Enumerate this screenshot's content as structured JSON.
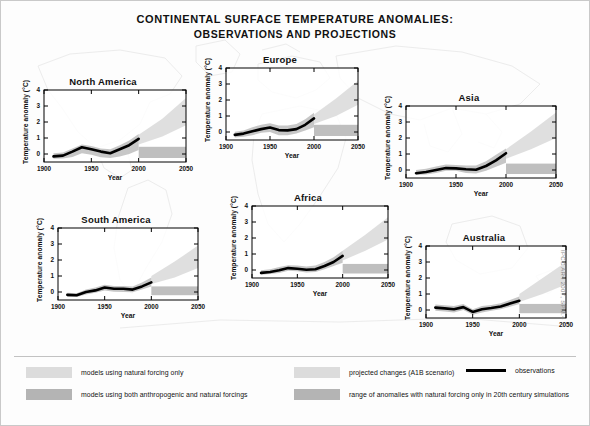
{
  "title": {
    "line1": "Continental Surface Temperature Anomalies:",
    "line2": "Observations and Projections"
  },
  "axis_labels": {
    "x": "Year",
    "y": "Temperature anomaly (°C)"
  },
  "source_credit": "IPCC AR4 2007, SPM.4",
  "legend": {
    "natural_only": "models using natural forcing only",
    "anthro_and_natural": "models using both anthropogenic and natural forcings",
    "projected": "projected changes (A1B scenario)",
    "range_20c": "range of anomalies with natural forcing only in 20th century simulations",
    "observations": "observations"
  },
  "colors": {
    "observation_line": "#000000",
    "natural_band": "#dcdcdc",
    "anthro_band": "#b4b4b4",
    "projection_wedge": "#dcdcdc",
    "range_band": "#b4b4b4",
    "map_outline": "#b9b9b9",
    "axis": "#000000",
    "divider": "#c2c2c2"
  },
  "chart_data": {
    "type": "line",
    "title": "Continental Surface Temperature Anomalies: Observations and Projections",
    "xlabel": "Year",
    "ylabel": "Temperature anomaly (°C)",
    "xlim": [
      1900,
      2050
    ],
    "ylim": [
      -0.5,
      4
    ],
    "xticks": [
      1900,
      1950,
      2000,
      2050
    ],
    "yticks": [
      0,
      1,
      2,
      3,
      4
    ],
    "grid": false,
    "legend_position": "bottom",
    "panels": [
      {
        "name": "North America",
        "x": [
          1910,
          1920,
          1930,
          1940,
          1950,
          1960,
          1970,
          1980,
          1990,
          2000
        ],
        "observations": [
          -0.15,
          -0.1,
          0.15,
          0.42,
          0.3,
          0.15,
          0.05,
          0.3,
          0.55,
          0.95
        ],
        "natural_band_low": [
          -0.3,
          -0.28,
          -0.18,
          0.05,
          -0.05,
          -0.2,
          -0.25,
          -0.15,
          0.0,
          0.25
        ],
        "natural_band_high": [
          0.05,
          0.1,
          0.35,
          0.6,
          0.5,
          0.35,
          0.3,
          0.55,
          0.85,
          1.25
        ],
        "projection": {
          "x": [
            2000,
            2025,
            2050
          ],
          "low": [
            0.6,
            1.1,
            1.8
          ],
          "high": [
            1.2,
            2.2,
            3.5
          ]
        },
        "range_band": {
          "x": [
            2000,
            2050
          ],
          "low": -0.25,
          "high": 0.45
        }
      },
      {
        "name": "Europe",
        "x": [
          1910,
          1920,
          1930,
          1940,
          1950,
          1960,
          1970,
          1980,
          1990,
          2000
        ],
        "observations": [
          -0.18,
          -0.1,
          0.05,
          0.18,
          0.28,
          0.12,
          0.1,
          0.18,
          0.45,
          0.85
        ],
        "natural_band_low": [
          -0.35,
          -0.3,
          -0.2,
          -0.05,
          0.0,
          -0.2,
          -0.2,
          -0.1,
          0.1,
          0.3
        ],
        "natural_band_high": [
          0.02,
          0.1,
          0.3,
          0.45,
          0.55,
          0.4,
          0.4,
          0.5,
          0.8,
          1.2
        ],
        "projection": {
          "x": [
            2000,
            2025,
            2050
          ],
          "low": [
            0.5,
            1.0,
            1.7
          ],
          "high": [
            1.1,
            2.1,
            3.2
          ]
        },
        "range_band": {
          "x": [
            2000,
            2050
          ],
          "low": -0.25,
          "high": 0.45
        }
      },
      {
        "name": "Asia",
        "x": [
          1910,
          1920,
          1930,
          1940,
          1950,
          1960,
          1970,
          1980,
          1990,
          2000
        ],
        "observations": [
          -0.2,
          -0.12,
          0.0,
          0.12,
          0.1,
          0.05,
          0.02,
          0.25,
          0.6,
          1.05
        ],
        "natural_band_low": [
          -0.32,
          -0.28,
          -0.18,
          -0.05,
          -0.05,
          -0.18,
          -0.22,
          -0.05,
          0.2,
          0.45
        ],
        "natural_band_high": [
          0.0,
          0.08,
          0.22,
          0.35,
          0.32,
          0.28,
          0.28,
          0.55,
          0.95,
          1.35
        ],
        "projection": {
          "x": [
            2000,
            2025,
            2050
          ],
          "low": [
            0.7,
            1.3,
            2.0
          ],
          "high": [
            1.3,
            2.4,
            3.6
          ]
        },
        "range_band": {
          "x": [
            2000,
            2050
          ],
          "low": -0.25,
          "high": 0.4
        }
      },
      {
        "name": "Africa",
        "x": [
          1910,
          1920,
          1930,
          1940,
          1950,
          1960,
          1970,
          1980,
          1990,
          2000
        ],
        "observations": [
          -0.18,
          -0.12,
          -0.02,
          0.12,
          0.08,
          0.02,
          0.05,
          0.25,
          0.5,
          0.88
        ],
        "natural_band_low": [
          -0.3,
          -0.25,
          -0.18,
          -0.05,
          -0.08,
          -0.15,
          -0.12,
          0.05,
          0.25,
          0.45
        ],
        "natural_band_high": [
          -0.02,
          0.05,
          0.18,
          0.3,
          0.28,
          0.22,
          0.28,
          0.5,
          0.8,
          1.2
        ],
        "projection": {
          "x": [
            2000,
            2025,
            2050
          ],
          "low": [
            0.6,
            1.2,
            1.9
          ],
          "high": [
            1.2,
            2.2,
            3.3
          ]
        },
        "range_band": {
          "x": [
            2000,
            2050
          ],
          "low": -0.22,
          "high": 0.38
        }
      },
      {
        "name": "South America",
        "x": [
          1910,
          1920,
          1930,
          1940,
          1950,
          1960,
          1970,
          1980,
          1990,
          2000
        ],
        "observations": [
          -0.18,
          -0.2,
          0.0,
          0.1,
          0.28,
          0.2,
          0.2,
          0.15,
          0.35,
          0.6
        ],
        "natural_band_low": [
          -0.3,
          -0.32,
          -0.15,
          -0.05,
          0.1,
          0.02,
          0.0,
          -0.02,
          0.15,
          0.35
        ],
        "natural_band_high": [
          -0.05,
          -0.08,
          0.15,
          0.28,
          0.45,
          0.38,
          0.38,
          0.35,
          0.6,
          0.9
        ],
        "projection": {
          "x": [
            2000,
            2025,
            2050
          ],
          "low": [
            0.5,
            0.9,
            1.5
          ],
          "high": [
            1.0,
            1.9,
            2.9
          ]
        },
        "range_band": {
          "x": [
            2000,
            2050
          ],
          "low": -0.2,
          "high": 0.35
        }
      },
      {
        "name": "Australia",
        "x": [
          1910,
          1920,
          1930,
          1940,
          1950,
          1960,
          1970,
          1980,
          1990,
          2000
        ],
        "observations": [
          0.15,
          0.1,
          0.05,
          0.18,
          -0.12,
          0.05,
          0.12,
          0.22,
          0.4,
          0.58
        ],
        "natural_band_low": [
          -0.05,
          -0.1,
          -0.15,
          0.0,
          -0.3,
          -0.15,
          -0.05,
          0.05,
          0.2,
          0.38
        ],
        "natural_band_high": [
          0.35,
          0.3,
          0.25,
          0.38,
          0.05,
          0.25,
          0.32,
          0.42,
          0.62,
          0.85
        ],
        "projection": {
          "x": [
            2000,
            2025,
            2050
          ],
          "low": [
            0.5,
            1.0,
            1.6
          ],
          "high": [
            1.0,
            2.0,
            3.0
          ]
        },
        "range_band": {
          "x": [
            2000,
            2050
          ],
          "low": -0.2,
          "high": 0.38
        }
      }
    ]
  },
  "panel_layout": [
    {
      "key": "North America",
      "left": 14,
      "top": 76,
      "w": 178,
      "h": 108
    },
    {
      "key": "Europe",
      "left": 196,
      "top": 54,
      "w": 168,
      "h": 108
    },
    {
      "key": "Asia",
      "left": 376,
      "top": 92,
      "w": 186,
      "h": 108
    },
    {
      "key": "Africa",
      "left": 222,
      "top": 192,
      "w": 172,
      "h": 108
    },
    {
      "key": "South America",
      "left": 28,
      "top": 214,
      "w": 176,
      "h": 108
    },
    {
      "key": "Australia",
      "left": 396,
      "top": 232,
      "w": 176,
      "h": 108
    }
  ]
}
